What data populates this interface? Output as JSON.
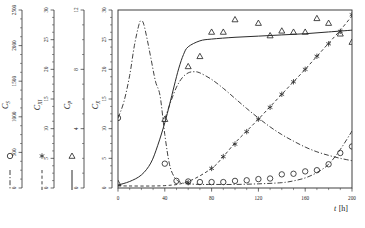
{
  "figure": {
    "xaxis": {
      "label": "t",
      "unit": "[h]",
      "label_full": "t [h]",
      "ticks": [
        0,
        40,
        80,
        120,
        160,
        200
      ],
      "min": 0,
      "max": 200,
      "minor_per_major": 4
    },
    "axes": [
      {
        "id": "cs",
        "symbol": "C",
        "subscript": "S",
        "ticks": [
          0,
          500,
          1000,
          1500,
          2000,
          2500
        ],
        "min": 0,
        "max": 2500,
        "marker": "circle",
        "line": "dash-dot",
        "minor_per_major": 4
      },
      {
        "id": "cxi",
        "symbol": "C",
        "subscript": "XI",
        "ticks": [
          0,
          5,
          10,
          15,
          20,
          25,
          30
        ],
        "min": 0,
        "max": 30,
        "marker": "asterisk",
        "line": "dashed",
        "minor_per_major": 4
      },
      {
        "id": "cp",
        "symbol": "C",
        "subscript": "P",
        "ticks": [
          0,
          4,
          8,
          12
        ],
        "min": 0,
        "max": 12,
        "marker": "triangle",
        "line": "solid",
        "minor_per_major": 4
      },
      {
        "id": "cx",
        "symbol": "C",
        "subscript": "X",
        "ticks": [
          0,
          5,
          10,
          15,
          20,
          25,
          30
        ],
        "min": 0,
        "max": 30,
        "marker": "none",
        "line": "none",
        "minor_per_major": 4
      }
    ],
    "legend": [
      {
        "marker": "circle",
        "line": "dash-dot",
        "series": "cs"
      },
      {
        "marker": "asterisk",
        "line": "dashed",
        "series": "cxi"
      },
      {
        "marker": "triangle",
        "line": "solid",
        "series": "cp"
      }
    ]
  },
  "chart_data": {
    "type": "line",
    "title": "",
    "xlabel": "t [h]",
    "ylabel": "",
    "xlim": [
      0,
      200
    ],
    "grid": false,
    "legend_position": "left-outside",
    "note": "Multi-axis batch fermentation kinetics. Four stacked vertical axes at left (C_S, C_XI, C_P, C_X); plot region is scaled on the C_X axis 0-30.",
    "series": [
      {
        "name": "C_S",
        "axis": "cs",
        "marker": "circle",
        "line": "dash-dot",
        "axis_ticks": [
          0,
          500,
          1000,
          1500,
          2000,
          2500
        ],
        "curve_x": [
          0,
          5,
          10,
          14,
          18,
          20,
          22,
          25,
          28,
          32,
          36,
          40,
          44,
          48,
          52,
          56,
          60,
          70,
          80,
          100,
          120,
          140,
          150,
          160,
          170,
          180,
          190,
          200
        ],
        "curve_y": [
          11.8,
          14.5,
          19.0,
          24.0,
          27.6,
          28.2,
          27.6,
          25.0,
          22.0,
          18.0,
          15.5,
          9.0,
          4.0,
          1.9,
          1.1,
          0.8,
          0.7,
          0.6,
          0.6,
          0.6,
          0.7,
          0.9,
          1.2,
          1.7,
          2.6,
          4.0,
          6.5,
          9.6
        ],
        "points_x": [
          0,
          40,
          50,
          60,
          70,
          80,
          90,
          100,
          110,
          120,
          130,
          140,
          150,
          160,
          170,
          180,
          190,
          200
        ],
        "points_y": [
          11.8,
          4.1,
          1.2,
          1.1,
          1.0,
          1.0,
          1.0,
          1.2,
          1.3,
          1.5,
          1.6,
          2.3,
          2.4,
          2.8,
          3.0,
          4.0,
          5.9,
          7.0
        ]
      },
      {
        "name": "C_XI",
        "axis": "cxi",
        "marker": "asterisk",
        "line": "dashed",
        "axis_ticks": [
          0,
          5,
          10,
          15,
          20,
          25,
          30
        ],
        "curve_x": [
          0,
          40,
          60,
          80,
          90,
          100,
          110,
          120,
          130,
          140,
          150,
          160,
          170,
          180,
          190,
          200
        ],
        "curve_y": [
          0.35,
          0.4,
          1.1,
          3.3,
          5.3,
          7.6,
          9.6,
          11.6,
          13.7,
          15.8,
          17.9,
          20.0,
          22.2,
          24.4,
          26.6,
          29.0
        ],
        "points_x": [
          60,
          80,
          90,
          100,
          110,
          120,
          130,
          140,
          150,
          160,
          170,
          180,
          190,
          200
        ],
        "points_y": [
          0.9,
          3.3,
          5.3,
          7.4,
          9.5,
          11.6,
          13.6,
          15.8,
          17.9,
          20.0,
          22.2,
          24.3,
          26.4,
          29.2
        ]
      },
      {
        "name": "C_P",
        "axis": "cp",
        "marker": "triangle",
        "line": "solid",
        "axis_ticks": [
          0,
          4,
          8,
          12
        ],
        "curve_x": [
          0,
          10,
          20,
          28,
          34,
          40,
          44,
          48,
          52,
          56,
          60,
          70,
          80,
          100,
          120,
          140,
          160,
          180,
          200
        ],
        "curve_y": [
          0.5,
          1.1,
          2.2,
          4.2,
          7.2,
          11.0,
          14.0,
          17.2,
          20.2,
          22.5,
          23.8,
          24.8,
          25.1,
          25.4,
          25.6,
          25.8,
          26.0,
          26.3,
          26.6
        ],
        "points_x": [
          0,
          40,
          60,
          70,
          80,
          90,
          100,
          120,
          130,
          140,
          150,
          160,
          170,
          180,
          190,
          200
        ],
        "points_y": [
          0.8,
          11.6,
          20.5,
          22.2,
          26.3,
          26.3,
          28.4,
          27.8,
          25.7,
          26.5,
          26.3,
          26.3,
          28.6,
          27.8,
          26.0,
          24.6
        ]
      },
      {
        "name": "C_X",
        "axis": "cx",
        "marker": "none",
        "line": "dash-dot-secondary",
        "axis_ticks": [
          0,
          5,
          10,
          15,
          20,
          25,
          30
        ],
        "curve_x": [
          40,
          45,
          50,
          55,
          60,
          65,
          70,
          80,
          90,
          100,
          110,
          120,
          130,
          140,
          150,
          160,
          170,
          180,
          190,
          200
        ],
        "curve_y": [
          11.6,
          14.5,
          17.0,
          18.6,
          19.4,
          19.6,
          19.4,
          18.3,
          16.8,
          15.1,
          13.4,
          11.8,
          10.3,
          9.0,
          7.9,
          6.9,
          6.1,
          5.5,
          5.0,
          4.6
        ]
      }
    ]
  }
}
